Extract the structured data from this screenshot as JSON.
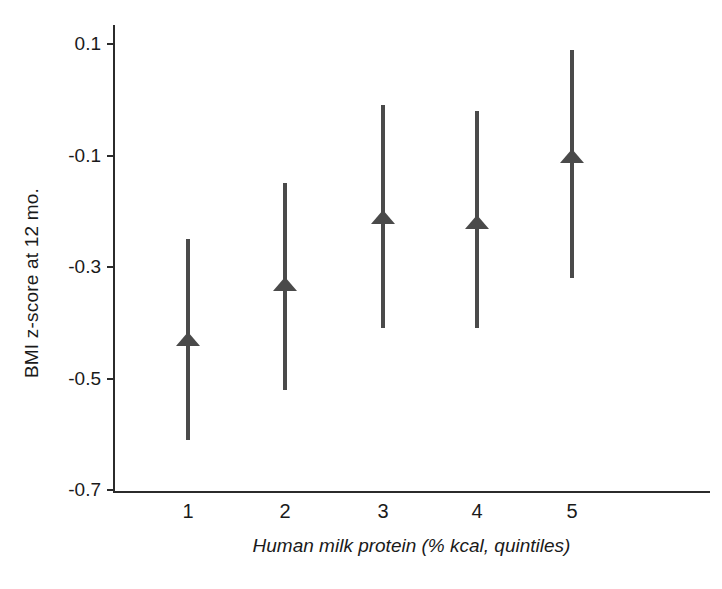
{
  "chart_data": {
    "type": "scatter",
    "title": "",
    "xlabel": "Human milk protein  (% kcal, quintiles)",
    "ylabel": "BMI z-score at 12 mo.",
    "categories": [
      "1",
      "2",
      "3",
      "4",
      "5"
    ],
    "xtick_labels": [
      "1",
      "2",
      "3",
      "4",
      "5"
    ],
    "ytick_labels": [
      "0.1",
      "-0.1",
      "-0.3",
      "-0.5",
      "-0.7"
    ],
    "ytick_values": [
      0.1,
      -0.1,
      -0.3,
      -0.5,
      -0.7
    ],
    "ylim": [
      -0.7,
      0.1
    ],
    "grid": false,
    "legend": null,
    "marker": "triangle-up",
    "marker_color": "#4a4a4a",
    "errorbar_color": "#4a4a4a",
    "axis_color": "#2b2b2b",
    "series": [
      {
        "name": "BMI z-score at 12 mo.",
        "values": [
          -0.43,
          -0.33,
          -0.21,
          -0.22,
          -0.1
        ],
        "error_low": [
          -0.61,
          -0.52,
          -0.41,
          -0.41,
          -0.32
        ],
        "error_high": [
          -0.25,
          -0.15,
          -0.01,
          -0.02,
          0.09
        ]
      }
    ],
    "points": [
      {
        "x": "1",
        "estimate": -0.43,
        "ci_lower": -0.61,
        "ci_upper": -0.25
      },
      {
        "x": "2",
        "estimate": -0.33,
        "ci_lower": -0.52,
        "ci_upper": -0.15
      },
      {
        "x": "3",
        "estimate": -0.21,
        "ci_lower": -0.41,
        "ci_upper": -0.01
      },
      {
        "x": "4",
        "estimate": -0.22,
        "ci_lower": -0.41,
        "ci_upper": -0.02
      },
      {
        "x": "5",
        "estimate": -0.1,
        "ci_lower": -0.32,
        "ci_upper": 0.09
      }
    ]
  }
}
